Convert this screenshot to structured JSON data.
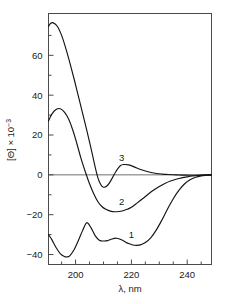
{
  "chart_data": {
    "type": "line",
    "title": "",
    "xlabel": "λ, nm",
    "ylabel": "[Θ] × 10⁻³",
    "ylabel_base": "[Θ] × 10",
    "ylabel_exponent": "−3",
    "xlim": [
      190.3,
      248.7
    ],
    "ylim": [
      -45.0,
      81.0
    ],
    "xticks": [
      200,
      220,
      240
    ],
    "xtick_labels": [
      "200",
      "220",
      "240"
    ],
    "xticks_minor": [
      195,
      205,
      210,
      215,
      225,
      230,
      235,
      245
    ],
    "yticks": [
      -40,
      -20,
      0,
      20,
      40,
      60
    ],
    "ytick_labels": [
      "−40",
      "−20",
      "0",
      "20",
      "40",
      "60"
    ],
    "yticks_minor": [
      -30,
      -10,
      10,
      30,
      50,
      70
    ],
    "grid": false,
    "legend": "inline-curve-labels",
    "zero_line": true,
    "series": [
      {
        "name": "1",
        "label": "1",
        "label_x": 220.0,
        "label_y": -30.0,
        "color": "#141414",
        "x": [
          190.3,
          191.5,
          193.0,
          194.5,
          196.0,
          197.0,
          198.0,
          199.5,
          201.0,
          202.5,
          204.0,
          205.5,
          207.0,
          208.5,
          210.0,
          211.5,
          213.0,
          214.5,
          216.0,
          217.5,
          219.0,
          220.5,
          222.0,
          223.5,
          225.0,
          227.0,
          229.0,
          231.0,
          233.0,
          235.0,
          237.0,
          239.0,
          241.0,
          243.0,
          245.0,
          247.0,
          248.7
        ],
        "y": [
          -30.0,
          -32.5,
          -36.5,
          -39.5,
          -41.0,
          -41.2,
          -40.5,
          -37.5,
          -33.0,
          -28.0,
          -24.0,
          -26.5,
          -30.5,
          -32.8,
          -33.2,
          -33.0,
          -32.2,
          -31.8,
          -32.3,
          -33.4,
          -34.5,
          -35.2,
          -35.4,
          -35.0,
          -34.0,
          -31.5,
          -27.5,
          -22.5,
          -17.0,
          -12.0,
          -7.8,
          -4.6,
          -2.5,
          -1.2,
          -0.5,
          -0.2,
          0.0
        ]
      },
      {
        "name": "2",
        "label": "2",
        "label_x": 216.5,
        "label_y": -13.5,
        "color": "#141414",
        "x": [
          190.3,
          191.5,
          193.0,
          194.5,
          196.0,
          197.5,
          199.0,
          200.5,
          202.0,
          203.5,
          205.0,
          206.5,
          208.0,
          209.5,
          211.0,
          212.5,
          214.0,
          215.5,
          217.0,
          218.5,
          220.0,
          222.0,
          224.0,
          226.0,
          228.0,
          230.0,
          232.0,
          234.0,
          236.0,
          238.0,
          240.0,
          242.0,
          244.0,
          246.0,
          248.7
        ],
        "y": [
          27.0,
          30.5,
          32.8,
          33.2,
          31.5,
          28.0,
          22.5,
          15.5,
          8.0,
          1.5,
          -4.5,
          -9.5,
          -13.5,
          -16.0,
          -17.4,
          -18.2,
          -18.5,
          -18.4,
          -18.0,
          -17.3,
          -16.3,
          -14.2,
          -12.0,
          -9.7,
          -7.6,
          -5.8,
          -4.3,
          -3.1,
          -2.2,
          -1.5,
          -1.0,
          -0.6,
          -0.3,
          -0.1,
          0.0
        ]
      },
      {
        "name": "3",
        "label": "3",
        "label_x": 216.5,
        "label_y": 8.5,
        "color": "#141414",
        "x": [
          190.3,
          191.0,
          192.0,
          193.5,
          195.0,
          196.5,
          198.0,
          199.5,
          201.0,
          202.5,
          204.0,
          205.5,
          207.0,
          208.0,
          209.0,
          210.0,
          211.5,
          213.0,
          214.5,
          216.0,
          217.5,
          219.0,
          221.0,
          223.0,
          225.0,
          227.0,
          229.0,
          231.0,
          233.0,
          235.0,
          237.0,
          239.0,
          241.0,
          243.0,
          245.0,
          247.0,
          248.7
        ],
        "y": [
          74.5,
          76.0,
          76.3,
          74.5,
          70.0,
          63.5,
          56.0,
          48.0,
          39.5,
          31.0,
          22.5,
          13.5,
          4.0,
          -1.5,
          -4.8,
          -6.2,
          -5.2,
          -2.0,
          1.8,
          4.6,
          5.2,
          5.0,
          4.0,
          2.8,
          1.9,
          1.2,
          0.7,
          0.4,
          0.2,
          0.05,
          -0.05,
          -0.15,
          -0.2,
          -0.2,
          -0.15,
          -0.05,
          0.0
        ]
      }
    ]
  },
  "axes": {
    "x_axis_name": "lambda-axis",
    "y_axis_name": "theta-axis"
  }
}
